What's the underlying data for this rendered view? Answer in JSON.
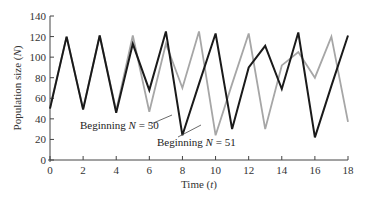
{
  "chart_data": {
    "type": "line",
    "title": "",
    "xlabel": "Time (t)",
    "ylabel": "Population size (N)",
    "xlim": [
      0,
      18
    ],
    "ylim": [
      0,
      140
    ],
    "x_ticks": [
      0,
      2,
      4,
      6,
      8,
      10,
      12,
      14,
      16,
      18
    ],
    "y_ticks": [
      0,
      20,
      40,
      60,
      80,
      100,
      120,
      140
    ],
    "grid": false,
    "legend": "none (inline annotations)",
    "x": [
      0,
      1,
      2,
      3,
      4,
      5,
      6,
      7,
      8,
      9,
      10,
      11,
      12,
      13,
      14,
      15,
      16,
      17,
      18
    ],
    "series": [
      {
        "name": "Beginning N = 50",
        "color": "#1a1a1a",
        "values": [
          50,
          120,
          49,
          121,
          46,
          113,
          68,
          125,
          24,
          74,
          123,
          30,
          90,
          111,
          69,
          124,
          22,
          72,
          121
        ]
      },
      {
        "name": "Beginning N = 51",
        "color": "#a6a6a6",
        "values": [
          51,
          120,
          50,
          121,
          48,
          121,
          47,
          113,
          70,
          125,
          24,
          74,
          123,
          30,
          92,
          105,
          80,
          120,
          37
        ]
      }
    ],
    "annotations": [
      {
        "text_prefix": "Beginning ",
        "var": "N",
        "text_suffix": " = 50",
        "series": 0
      },
      {
        "text_prefix": "Beginning ",
        "var": "N",
        "text_suffix": " = 51",
        "series": 1
      }
    ]
  },
  "axes": {
    "xlabel_prefix": "Time (",
    "xlabel_var": "t",
    "xlabel_suffix": ")",
    "ylabel_prefix": "Population size (",
    "ylabel_var": "N",
    "ylabel_suffix": ")"
  }
}
